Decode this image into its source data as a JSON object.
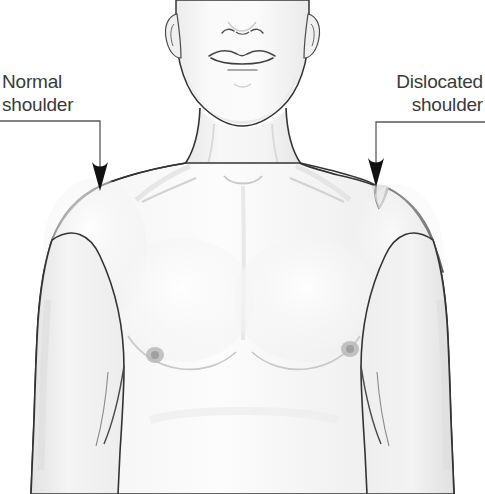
{
  "illustration": {
    "subject": "anterior view of male upper torso, head cropped at mid-face",
    "background_color": "#ffffff",
    "outline_color": "#333333",
    "skin_fill_light": "#fafafa",
    "skin_fill_mid": "#f1f1f1",
    "skin_fill_shadow": "#e6e6e6",
    "text_color": "#3a3a3a",
    "leader_line_color": "#5a5a5a"
  },
  "callouts": [
    {
      "id": "normal",
      "label": "Normal\nshoulder",
      "line1": "Normal",
      "line2": "shoulder",
      "align": "left",
      "leader": {
        "start_x": 0,
        "start_y": 121,
        "elbow_x": 100,
        "elbow_y": 121,
        "end_x": 100,
        "end_y": 183
      },
      "arrow_tip_x": 100,
      "arrow_tip_y": 190
    },
    {
      "id": "dislocated",
      "label": "Dislocated\nshoulder",
      "line1": "Dislocated",
      "line2": "shoulder",
      "align": "right",
      "leader": {
        "start_x": 485,
        "start_y": 122,
        "elbow_x": 376,
        "elbow_y": 122,
        "end_x": 376,
        "end_y": 178
      },
      "arrow_tip_x": 376,
      "arrow_tip_y": 186
    }
  ],
  "anatomy": {
    "head": "cropped cranium, ears, nose, mouth, chin, jawline",
    "neck": "cylindrical neck with sternocleidomastoid shading",
    "left_shoulder": "smooth rounded deltoid contour (normal)",
    "right_shoulder": "squared-off step deformity with sub-acromial notch (dislocated)",
    "chest": "pectoral muscles with inframammary creases and two nipples",
    "arms": "both upper arms cropped at lower image edge",
    "axilla": "armpit creases visible on both sides"
  }
}
